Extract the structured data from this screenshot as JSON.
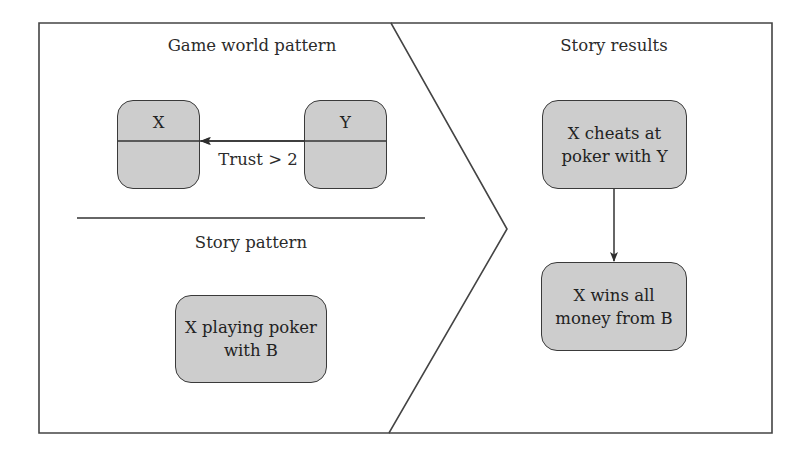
{
  "left_panel": {
    "top_section": {
      "title": "Game world pattern",
      "nodes": [
        {
          "id": "X",
          "label": "X"
        },
        {
          "id": "Y",
          "label": "Y"
        }
      ],
      "edge": {
        "from": "Y",
        "to": "X",
        "label": "Trust > 2"
      }
    },
    "bottom_section": {
      "title": "Story pattern",
      "nodes": [
        {
          "id": "poker",
          "label": "X playing poker with B",
          "line1": "X playing poker",
          "line2": "with B"
        }
      ]
    }
  },
  "right_panel": {
    "title": "Story results",
    "nodes": [
      {
        "id": "cheats",
        "label": "X cheats at poker with Y",
        "line1": "X cheats at",
        "line2": "poker with Y"
      },
      {
        "id": "wins",
        "label": "X wins all money from B",
        "line1": "X wins all",
        "line2": "money from B"
      }
    ],
    "edge": {
      "from": "cheats",
      "to": "wins"
    }
  },
  "colors": {
    "node_fill": "#cdcdcd",
    "stroke": "#3a3a3a",
    "background": "#ffffff"
  }
}
